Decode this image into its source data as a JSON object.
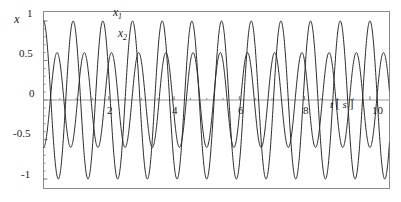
{
  "chart_data": {
    "type": "line",
    "title": "",
    "xlabel": "t [s]",
    "ylabel": "x",
    "xlim": [
      0,
      10.6
    ],
    "ylim": [
      -1.12,
      1.12
    ],
    "grid": false,
    "legend_position": "inline-annotation",
    "x_ticks": [
      0,
      2,
      4,
      6,
      8,
      10
    ],
    "x_tick_labels": [
      "",
      "2",
      "4",
      "6",
      "8",
      "10"
    ],
    "y_ticks": [
      -1,
      -0.5,
      0,
      0.5,
      1
    ],
    "y_tick_labels": [
      "-1",
      "-0.5",
      "0",
      "0.5",
      "1"
    ],
    "series": [
      {
        "name": "x1",
        "label": "x",
        "subscript": "1",
        "color": "#2b2b2b",
        "amplitude": 1.0,
        "frequency_hz": 1.1,
        "phase": 1.5707963,
        "offset": 0.0,
        "samples": 1400
      },
      {
        "name": "x2",
        "label": "x",
        "subscript": "2",
        "color": "#2b2b2b",
        "amplitude": 0.6,
        "frequency_hz": 1.2,
        "phase": -1.5707963,
        "offset": 0.0,
        "samples": 1400
      }
    ]
  },
  "axes": {
    "y_title": "x",
    "x_title_symbol": "t",
    "x_title_unit_open": "[",
    "x_title_unit": "s",
    "x_title_unit_close": "]",
    "tick_1": "1",
    "tick_05": "0.5",
    "tick_0": "0",
    "tick_m05": "-0.5",
    "tick_m1": "-1",
    "tick_x2": "2",
    "tick_x4": "4",
    "tick_x6": "6",
    "tick_x8": "8",
    "tick_x10": "10"
  },
  "annotations": {
    "series1_label": "x",
    "series1_sub": "1",
    "series2_label": "x",
    "series2_sub": "2"
  },
  "style": {
    "frame_color": "#8a8a8a",
    "curve_color": "#2b2b2b",
    "zero_line_color": "#9a9a9a",
    "background": "#ffffff",
    "text_color": "#1c1c1c"
  }
}
